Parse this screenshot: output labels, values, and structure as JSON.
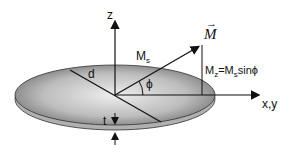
{
  "diagram": {
    "labels": {
      "z_axis": "z",
      "xy_axis": "x,y",
      "vector": "M",
      "ms": "M",
      "ms_sub": "s",
      "mz": "M",
      "mz_sub": "z",
      "mz_eq": "=M",
      "mz_eq_sub": "s",
      "mz_tail": "sinϕ",
      "angle": "ϕ",
      "diameter": "d",
      "thickness": "t"
    },
    "colors": {
      "disk_dark": "#7a7a7a",
      "disk_light": "#e6e6e6",
      "rim": "#a8a8a8",
      "line": "#111111"
    }
  }
}
